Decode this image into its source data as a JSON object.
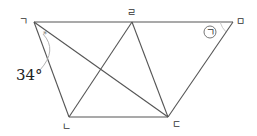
{
  "diagram": {
    "points": {
      "A": {
        "label": "ㄱ",
        "x": 34,
        "y": 22
      },
      "R": {
        "label": "ㄹ",
        "x": 132,
        "y": 22
      },
      "M": {
        "label": "ㅁ",
        "x": 233,
        "y": 22
      },
      "N": {
        "label": "ㄴ",
        "x": 69,
        "y": 117
      },
      "D": {
        "label": "ㄷ",
        "x": 168,
        "y": 117
      }
    },
    "segments": [
      [
        "ㄱ",
        "ㅁ"
      ],
      [
        "ㄱ",
        "ㄴ"
      ],
      [
        "ㄴ",
        "ㄷ"
      ],
      [
        "ㄷ",
        "ㅁ"
      ],
      [
        "ㄱ",
        "ㄷ"
      ],
      [
        "ㄴ",
        "ㄹ"
      ],
      [
        "ㄹ",
        "ㄷ"
      ]
    ],
    "angle_label": "34°",
    "unknown_angle_label": "ㄱ",
    "angle_mark": "*"
  }
}
